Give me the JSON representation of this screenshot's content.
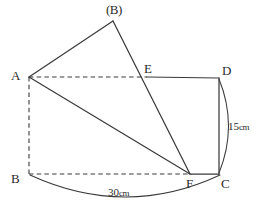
{
  "figure": {
    "canvas": {
      "width": 264,
      "height": 208
    },
    "stroke_color": "#3a3a3a",
    "text_color": "#2b2b2b",
    "background_color": "#ffffff"
  },
  "points": {
    "A": {
      "label": "A",
      "x": 29,
      "y": 77
    },
    "B_prime": {
      "label": "(B)",
      "x": 113,
      "y": 21
    },
    "E": {
      "label": "E",
      "x": 147,
      "y": 77
    },
    "D": {
      "label": "D",
      "x": 219,
      "y": 78
    },
    "F": {
      "label": "F",
      "x": 190,
      "y": 174
    },
    "C": {
      "label": "C",
      "x": 219,
      "y": 174
    },
    "B": {
      "label": "B",
      "x": 29,
      "y": 174
    }
  },
  "label_positions": {
    "A": {
      "left": 11,
      "top": 69
    },
    "B_prime": {
      "left": 106,
      "top": 3
    },
    "E": {
      "left": 144,
      "top": 62
    },
    "D": {
      "left": 222,
      "top": 64
    },
    "F": {
      "left": 186,
      "top": 177
    },
    "C": {
      "left": 221,
      "top": 177
    },
    "B": {
      "left": 11,
      "top": 172
    }
  },
  "solid_edges": [
    {
      "name": "edge-A-to-Bprime",
      "from": "A",
      "to": "B_prime"
    },
    {
      "name": "edge-Bprime-to-F",
      "from": "B_prime",
      "to": "F"
    },
    {
      "name": "edge-A-to-F",
      "from": "A",
      "to": "F"
    },
    {
      "name": "edge-E-to-D",
      "from": "E",
      "to": "D"
    },
    {
      "name": "edge-D-to-C",
      "from": "D",
      "to": "C"
    },
    {
      "name": "edge-F-to-C",
      "from": "F",
      "to": "C"
    }
  ],
  "dashed_edges": [
    {
      "name": "edge-A-to-E",
      "from": "A",
      "to": "E"
    },
    {
      "name": "edge-A-to-B",
      "from": "A",
      "to": "B"
    },
    {
      "name": "edge-B-to-F",
      "from": "B",
      "to": "F"
    }
  ],
  "arcs": [
    {
      "name": "arc-D-to-C",
      "path": "M 219 79 Q 238 126 219 173",
      "dimension": "15cm"
    },
    {
      "name": "arc-B-to-C",
      "path": "M 30 175 Q 126 219 220 175",
      "dimension": "30cm"
    }
  ],
  "dimensions": {
    "radius_small": {
      "value": "15",
      "unit": "cm",
      "text": "15cm",
      "left": 228,
      "top": 121
    },
    "radius_large": {
      "value": "30",
      "unit": "cm",
      "text": "30cm",
      "left": 108,
      "top": 187
    }
  }
}
